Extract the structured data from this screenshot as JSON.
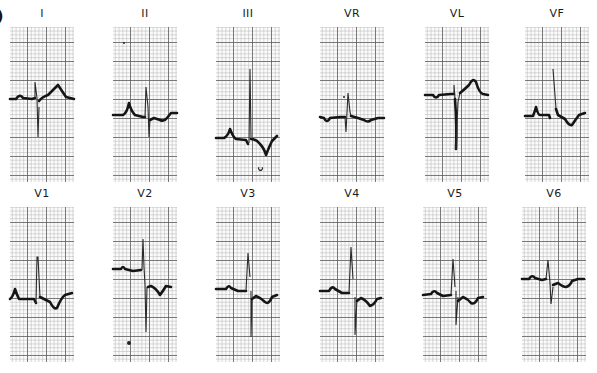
{
  "figure": {
    "panel_letter": ")",
    "rows": [
      {
        "leads": [
          {
            "label": "I",
            "x": 10,
            "y": 27
          },
          {
            "label": "II",
            "x": 113,
            "y": 27
          },
          {
            "label": "III",
            "x": 216,
            "y": 27
          },
          {
            "label": "VR",
            "x": 320,
            "y": 27
          },
          {
            "label": "VL",
            "x": 425,
            "y": 27
          },
          {
            "label": "VF",
            "x": 525,
            "y": 27
          }
        ]
      },
      {
        "leads": [
          {
            "label": "V1",
            "x": 10,
            "y": 207
          },
          {
            "label": "V2",
            "x": 113,
            "y": 207
          },
          {
            "label": "V3",
            "x": 216,
            "y": 207
          },
          {
            "label": "V4",
            "x": 320,
            "y": 207
          },
          {
            "label": "V5",
            "x": 423,
            "y": 207
          },
          {
            "label": "V6",
            "x": 522,
            "y": 207
          }
        ]
      }
    ]
  },
  "colors": {
    "paper": "#fbfbfb",
    "grid_major": "#5a5a5a",
    "grid_minor": "#aaaaaa",
    "trace": "#151515"
  }
}
